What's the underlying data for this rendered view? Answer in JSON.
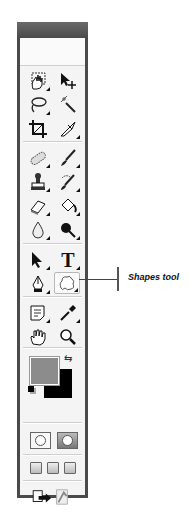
{
  "toolbar": {
    "tools": [
      {
        "name": "marquee-tool",
        "icon": "hand-marquee-icon"
      },
      {
        "name": "move-tool",
        "icon": "move-arrow-icon"
      },
      {
        "name": "lasso-tool",
        "icon": "lasso-icon"
      },
      {
        "name": "magic-wand-tool",
        "icon": "magic-wand-icon"
      },
      {
        "name": "crop-tool",
        "icon": "crop-icon"
      },
      {
        "name": "slice-tool",
        "icon": "slice-knife-icon"
      },
      {
        "name": "healing-brush-tool",
        "icon": "bandage-icon"
      },
      {
        "name": "brush-tool",
        "icon": "brush-icon"
      },
      {
        "name": "clone-stamp-tool",
        "icon": "stamp-icon"
      },
      {
        "name": "history-brush-tool",
        "icon": "history-brush-icon"
      },
      {
        "name": "eraser-tool",
        "icon": "eraser-icon"
      },
      {
        "name": "paint-bucket-tool",
        "icon": "paint-bucket-icon"
      },
      {
        "name": "blur-tool",
        "icon": "drop-icon"
      },
      {
        "name": "dodge-tool",
        "icon": "dodge-icon"
      },
      {
        "name": "path-selection-tool",
        "icon": "arrow-icon"
      },
      {
        "name": "type-tool",
        "icon": "type-icon",
        "label": "T"
      },
      {
        "name": "pen-tool",
        "icon": "pen-nib-icon"
      },
      {
        "name": "shapes-tool",
        "icon": "custom-shape-icon",
        "selected": true
      },
      {
        "name": "notes-tool",
        "icon": "notes-icon"
      },
      {
        "name": "eyedropper-tool",
        "icon": "eyedropper-icon"
      },
      {
        "name": "hand-tool",
        "icon": "hand-icon"
      },
      {
        "name": "zoom-tool",
        "icon": "magnifier-icon"
      }
    ],
    "colors": {
      "foreground": "#8c8c8c",
      "background": "#000000"
    },
    "swap_glyph": "⇆"
  },
  "callout": {
    "label": "Shapes tool"
  }
}
